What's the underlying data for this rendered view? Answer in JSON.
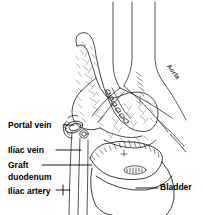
{
  "figure": {
    "background_color": "#ffffff",
    "ink_color": "#000000",
    "style": "black and white medical line drawing"
  },
  "labels": {
    "portal_vein": "Portal vein",
    "iliac_vein": "Iliac vein",
    "graft": "Graft",
    "duodenum": "duodenum",
    "iliac_artery": "Iliac artery",
    "bladder": "Bladder",
    "aorta": "Aorta"
  },
  "structures": [
    {
      "name": "pancreas-graft",
      "description": "stippled lobulated pancreas graft, tail superior"
    },
    {
      "name": "graft-duodenum",
      "description": "duodenal segment with suture line"
    },
    {
      "name": "bladder",
      "description": "bladder dome with oval anastomosis"
    },
    {
      "name": "aorta",
      "description": "great vessel bifurcation upper right"
    },
    {
      "name": "iliac-vessels",
      "description": "vertical vessel lines descending left"
    },
    {
      "name": "vascular-anastomosis",
      "description": "beaded sutured vessel junction"
    }
  ]
}
